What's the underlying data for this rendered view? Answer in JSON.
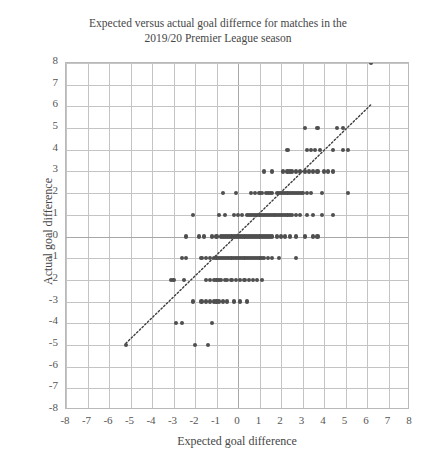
{
  "chart_data": {
    "type": "scatter",
    "title": "Expected versus actual goal differnce for matches in the\n2019/20 Premier League season",
    "xlabel": "Expected goal difference",
    "ylabel": "Actual goal difference",
    "xlim": [
      -8,
      8
    ],
    "ylim": [
      -8,
      8
    ],
    "xticks": [
      "-8",
      "-7",
      "-6",
      "-5",
      "-4",
      "-3",
      "-2",
      "-1",
      "0",
      "1",
      "2",
      "3",
      "4",
      "5",
      "6",
      "7",
      "8"
    ],
    "yticks": [
      "8",
      "7",
      "6",
      "5",
      "4",
      "3",
      "2",
      "1",
      "0",
      "-1",
      "-2",
      "-3",
      "-4",
      "-5",
      "-6",
      "-7",
      "-8"
    ],
    "grid": true,
    "legend": "none",
    "marker_color": "#4f4f4f",
    "grid_color": "#c9c9c9",
    "reference_line": {
      "style": "dotted",
      "color": "#3d3d3d",
      "x_start": -5.2,
      "y_start": -5.0,
      "x_end": 6.3,
      "y_end": 6.1,
      "description": "y = x identity line"
    },
    "series": [
      {
        "name": "Premier League matches 2019/20",
        "points": [
          [
            6.2,
            8
          ],
          [
            3.1,
            5
          ],
          [
            3.7,
            5
          ],
          [
            4.6,
            5
          ],
          [
            4.9,
            5
          ],
          [
            2.3,
            4
          ],
          [
            3.2,
            4
          ],
          [
            3.4,
            4
          ],
          [
            3.6,
            4
          ],
          [
            3.8,
            4
          ],
          [
            4.4,
            4
          ],
          [
            4.9,
            4
          ],
          [
            5.1,
            4
          ],
          [
            1.2,
            3
          ],
          [
            1.6,
            3
          ],
          [
            2.1,
            3
          ],
          [
            2.3,
            3
          ],
          [
            2.4,
            3
          ],
          [
            2.5,
            3
          ],
          [
            2.7,
            3
          ],
          [
            2.9,
            3
          ],
          [
            3.1,
            3
          ],
          [
            3.3,
            3
          ],
          [
            3.5,
            3
          ],
          [
            3.7,
            3
          ],
          [
            4.0,
            3
          ],
          [
            4.2,
            3
          ],
          [
            4.4,
            3
          ],
          [
            -0.7,
            2
          ],
          [
            -0.1,
            2
          ],
          [
            0.6,
            2
          ],
          [
            0.8,
            2
          ],
          [
            1.0,
            2
          ],
          [
            1.1,
            2
          ],
          [
            1.3,
            2
          ],
          [
            1.4,
            2
          ],
          [
            1.5,
            2
          ],
          [
            1.6,
            2
          ],
          [
            1.8,
            2
          ],
          [
            1.9,
            2
          ],
          [
            2.0,
            2
          ],
          [
            2.1,
            2
          ],
          [
            2.2,
            2
          ],
          [
            2.3,
            2
          ],
          [
            2.4,
            2
          ],
          [
            2.5,
            2
          ],
          [
            2.6,
            2
          ],
          [
            2.7,
            2
          ],
          [
            2.8,
            2
          ],
          [
            2.9,
            2
          ],
          [
            3.0,
            2
          ],
          [
            3.2,
            2
          ],
          [
            3.4,
            2
          ],
          [
            3.9,
            2
          ],
          [
            5.1,
            2
          ],
          [
            -2.1,
            1
          ],
          [
            -0.9,
            1
          ],
          [
            -0.6,
            1
          ],
          [
            -0.2,
            1
          ],
          [
            0.0,
            1
          ],
          [
            0.2,
            1
          ],
          [
            0.4,
            1
          ],
          [
            0.5,
            1
          ],
          [
            0.6,
            1
          ],
          [
            0.7,
            1
          ],
          [
            0.8,
            1
          ],
          [
            0.9,
            1
          ],
          [
            1.0,
            1
          ],
          [
            1.1,
            1
          ],
          [
            1.2,
            1
          ],
          [
            1.3,
            1
          ],
          [
            1.4,
            1
          ],
          [
            1.5,
            1
          ],
          [
            1.6,
            1
          ],
          [
            1.7,
            1
          ],
          [
            1.8,
            1
          ],
          [
            1.9,
            1
          ],
          [
            2.0,
            1
          ],
          [
            2.1,
            1
          ],
          [
            2.2,
            1
          ],
          [
            2.3,
            1
          ],
          [
            2.4,
            1
          ],
          [
            2.5,
            1
          ],
          [
            2.7,
            1
          ],
          [
            2.9,
            1
          ],
          [
            3.2,
            1
          ],
          [
            3.5,
            1
          ],
          [
            3.9,
            1
          ],
          [
            4.4,
            1
          ],
          [
            -2.4,
            0
          ],
          [
            -1.8,
            0
          ],
          [
            -1.6,
            0
          ],
          [
            -1.2,
            0
          ],
          [
            -1.0,
            0
          ],
          [
            -0.8,
            0
          ],
          [
            -0.7,
            0
          ],
          [
            -0.6,
            0
          ],
          [
            -0.5,
            0
          ],
          [
            -0.4,
            0
          ],
          [
            -0.3,
            0
          ],
          [
            -0.2,
            0
          ],
          [
            -0.1,
            0
          ],
          [
            0.0,
            0
          ],
          [
            0.1,
            0
          ],
          [
            0.2,
            0
          ],
          [
            0.3,
            0
          ],
          [
            0.4,
            0
          ],
          [
            0.5,
            0
          ],
          [
            0.6,
            0
          ],
          [
            0.7,
            0
          ],
          [
            0.8,
            0
          ],
          [
            0.9,
            0
          ],
          [
            1.0,
            0
          ],
          [
            1.1,
            0
          ],
          [
            1.2,
            0
          ],
          [
            1.3,
            0
          ],
          [
            1.4,
            0
          ],
          [
            1.5,
            0
          ],
          [
            1.6,
            0
          ],
          [
            1.8,
            0
          ],
          [
            2.0,
            0
          ],
          [
            2.2,
            0
          ],
          [
            2.4,
            0
          ],
          [
            2.7,
            0
          ],
          [
            3.1,
            0
          ],
          [
            3.5,
            0
          ],
          [
            3.7,
            0
          ],
          [
            -2.6,
            -1
          ],
          [
            -2.4,
            -1
          ],
          [
            -1.7,
            -1
          ],
          [
            -1.5,
            -1
          ],
          [
            -1.3,
            -1
          ],
          [
            -1.1,
            -1
          ],
          [
            -1.0,
            -1
          ],
          [
            -0.9,
            -1
          ],
          [
            -0.8,
            -1
          ],
          [
            -0.7,
            -1
          ],
          [
            -0.6,
            -1
          ],
          [
            -0.5,
            -1
          ],
          [
            -0.4,
            -1
          ],
          [
            -0.3,
            -1
          ],
          [
            -0.2,
            -1
          ],
          [
            -0.1,
            -1
          ],
          [
            0.0,
            -1
          ],
          [
            0.1,
            -1
          ],
          [
            0.2,
            -1
          ],
          [
            0.3,
            -1
          ],
          [
            0.4,
            -1
          ],
          [
            0.5,
            -1
          ],
          [
            0.6,
            -1
          ],
          [
            0.7,
            -1
          ],
          [
            0.8,
            -1
          ],
          [
            0.9,
            -1
          ],
          [
            1.0,
            -1
          ],
          [
            1.1,
            -1
          ],
          [
            1.2,
            -1
          ],
          [
            1.4,
            -1
          ],
          [
            1.6,
            -1
          ],
          [
            1.9,
            -1
          ],
          [
            2.7,
            -1
          ],
          [
            -3.1,
            -2
          ],
          [
            -3.0,
            -2
          ],
          [
            -2.5,
            -2
          ],
          [
            -1.5,
            -2
          ],
          [
            -1.3,
            -2
          ],
          [
            -1.1,
            -2
          ],
          [
            -1.0,
            -2
          ],
          [
            -0.9,
            -2
          ],
          [
            -0.8,
            -2
          ],
          [
            -0.6,
            -2
          ],
          [
            -0.5,
            -2
          ],
          [
            -0.3,
            -2
          ],
          [
            -0.1,
            -2
          ],
          [
            0.1,
            -2
          ],
          [
            0.3,
            -2
          ],
          [
            0.5,
            -2
          ],
          [
            0.7,
            -2
          ],
          [
            0.9,
            -2
          ],
          [
            1.1,
            -2
          ],
          [
            -2.1,
            -3
          ],
          [
            -1.7,
            -3
          ],
          [
            -1.5,
            -3
          ],
          [
            -1.3,
            -3
          ],
          [
            -1.1,
            -3
          ],
          [
            -1.0,
            -3
          ],
          [
            -0.9,
            -3
          ],
          [
            -0.7,
            -3
          ],
          [
            -0.5,
            -3
          ],
          [
            -0.2,
            -3
          ],
          [
            0.1,
            -3
          ],
          [
            0.4,
            -3
          ],
          [
            -2.9,
            -4
          ],
          [
            -2.6,
            -4
          ],
          [
            -1.2,
            -4
          ],
          [
            -5.2,
            -5
          ],
          [
            -2.0,
            -5
          ],
          [
            -1.4,
            -5
          ]
        ]
      }
    ]
  }
}
